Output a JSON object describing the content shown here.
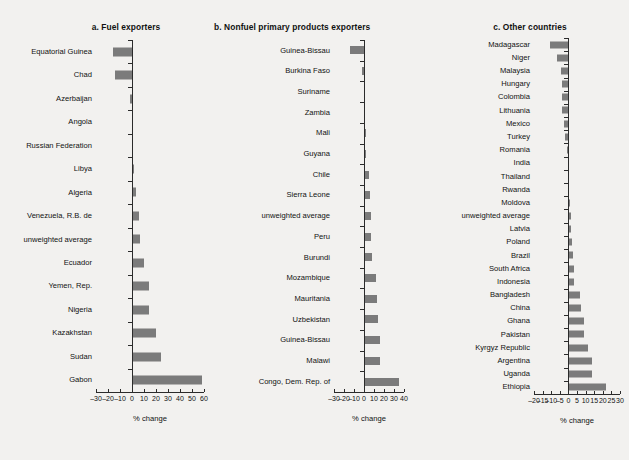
{
  "figure": {
    "background": "#f2f1ef",
    "bar_color": "#7b7b7b",
    "axis_color": "#2b2b2b"
  },
  "chart_data": [
    {
      "type": "bar",
      "orientation": "horizontal",
      "title": "a.  Fuel exporters",
      "xlabel": "% change",
      "ylabel": "",
      "xlim": [
        -30,
        60
      ],
      "xticks": [
        -30,
        -20,
        -10,
        0,
        10,
        20,
        30,
        40,
        50,
        60
      ],
      "xticklabels": [
        "–30",
        "–20",
        "–10",
        "0",
        "10",
        "20",
        "30",
        "40",
        "50",
        "60"
      ],
      "grid": false,
      "legend": "none",
      "categories": [
        "Equatorial Guinea",
        "Chad",
        "Azerbaijan",
        "Angola",
        "Russian Federation",
        "Libya",
        "Algeria",
        "Venezuela, R.B. de",
        "unweighted average",
        "Ecuador",
        "Yemen, Rep.",
        "Nigeria",
        "Kazakhstan",
        "Sudan",
        "Gabon"
      ],
      "values": [
        -16,
        -14,
        -1.5,
        -0.3,
        -0.3,
        2,
        3,
        5.5,
        6.5,
        10,
        14,
        14.5,
        20,
        24,
        58
      ]
    },
    {
      "type": "bar",
      "orientation": "horizontal",
      "title": "b.  Nonfuel primary products exporters",
      "xlabel": "% change",
      "ylabel": "",
      "xlim": [
        -30,
        40
      ],
      "xticks": [
        -30,
        -20,
        -10,
        0,
        10,
        20,
        30,
        40
      ],
      "xticklabels": [
        "–30",
        "–20",
        "–10",
        "0",
        "10",
        "20",
        "30",
        "40"
      ],
      "grid": false,
      "legend": "none",
      "categories": [
        "Guinea-Bissau",
        "Burkina Faso",
        "Suriname",
        "Zambia",
        "Mali",
        "Guyana",
        "Chile",
        "Sierra Leone",
        "unweighted average",
        "Peru",
        "Burundi",
        "Mozambique",
        "Mauritania",
        "Uzbekistan",
        "Guinea-Bissau",
        "Malawi",
        "Congo, Dem. Rep. of"
      ],
      "values": [
        -14,
        -2,
        0.2,
        1,
        1.5,
        2,
        5,
        5.5,
        7,
        7,
        8,
        12,
        12.5,
        13.5,
        16,
        16,
        35
      ]
    },
    {
      "type": "bar",
      "orientation": "horizontal",
      "title": "c.  Other countries",
      "xlabel": "% change",
      "ylabel": "",
      "xlim": [
        -20,
        30
      ],
      "xticks": [
        -20,
        -15,
        -10,
        -5,
        0,
        5,
        10,
        15,
        20,
        25,
        30
      ],
      "xticklabels": [
        "–20",
        "–15",
        "–10",
        "–5",
        "0",
        "5",
        "10",
        "15",
        "20",
        "25",
        "30"
      ],
      "grid": false,
      "legend": "none",
      "categories": [
        "Madagascar",
        "Niger",
        "Malaysia",
        "Hungary",
        "Colombia",
        "Lithuania",
        "Mexico",
        "Turkey",
        "Romania",
        "India",
        "Thailand",
        "Rwanda",
        "Moldova",
        "unweighted average",
        "Latvia",
        "Poland",
        "Brazil",
        "South Africa",
        "Indonesia",
        "Bangladesh",
        "China",
        "Ghana",
        "Pakistan",
        "Kyrgyz Republic",
        "Argentina",
        "Uganda",
        "Ethiopia"
      ],
      "values": [
        -10.5,
        -6.5,
        -4.5,
        -4,
        -3.5,
        -4,
        -2.5,
        -2,
        -1,
        -0.4,
        -0.2,
        0.4,
        1,
        1.5,
        1.8,
        2,
        2.8,
        3,
        3.2,
        6.5,
        7.5,
        9,
        9.2,
        11.5,
        13.5,
        14,
        22
      ]
    }
  ]
}
